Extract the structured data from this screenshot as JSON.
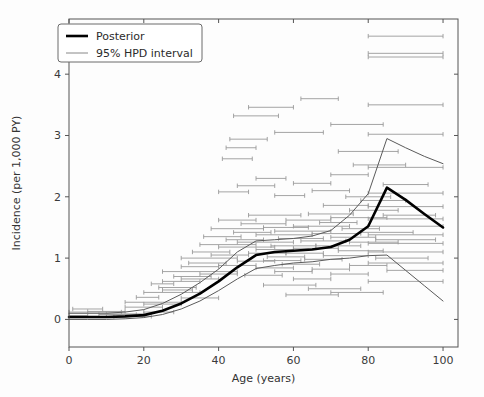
{
  "chart_data": {
    "type": "line",
    "title": "",
    "xlabel": "Age (years)",
    "ylabel": "Incidence (per 1,000 PY)",
    "xlim": [
      0,
      104
    ],
    "ylim": [
      -0.45,
      4.9
    ],
    "xticks": [
      0,
      20,
      40,
      60,
      80,
      100
    ],
    "xtick_labels": [
      "0",
      "20",
      "40",
      "60",
      "80",
      "100"
    ],
    "yticks": [
      0,
      1,
      2,
      3,
      4
    ],
    "ytick_labels": [
      "0",
      "1",
      "2",
      "3",
      "4"
    ],
    "grid": false,
    "legend_position": "upper left",
    "legend": [
      {
        "label": "Posterior",
        "color": "#000000",
        "linewidth": 2.6
      },
      {
        "label": "95% HPD interval",
        "color": "#888888",
        "linewidth": 1.0
      }
    ],
    "series": [
      {
        "name": "Posterior",
        "color": "#000000",
        "linewidth": 2.6,
        "x": [
          0,
          5,
          10,
          15,
          20,
          25,
          30,
          35,
          40,
          45,
          50,
          55,
          60,
          65,
          70,
          75,
          80,
          85,
          90,
          95,
          100
        ],
        "y": [
          0.04,
          0.04,
          0.04,
          0.05,
          0.07,
          0.14,
          0.26,
          0.42,
          0.62,
          0.85,
          1.05,
          1.1,
          1.12,
          1.14,
          1.18,
          1.3,
          1.52,
          2.15,
          1.95,
          1.72,
          1.5
        ]
      },
      {
        "name": "HPD upper",
        "color": "#5a5a5a",
        "linewidth": 1.0,
        "x": [
          0,
          5,
          10,
          15,
          20,
          25,
          30,
          35,
          40,
          45,
          50,
          55,
          60,
          65,
          70,
          75,
          80,
          85,
          90,
          95,
          100
        ],
        "y": [
          0.1,
          0.1,
          0.1,
          0.12,
          0.16,
          0.26,
          0.41,
          0.6,
          0.82,
          1.1,
          1.28,
          1.3,
          1.32,
          1.36,
          1.45,
          1.7,
          2.05,
          2.95,
          2.8,
          2.66,
          2.54
        ]
      },
      {
        "name": "HPD lower",
        "color": "#5a5a5a",
        "linewidth": 1.0,
        "x": [
          0,
          5,
          10,
          15,
          20,
          25,
          30,
          35,
          40,
          45,
          50,
          55,
          60,
          65,
          70,
          75,
          80,
          85,
          90,
          95,
          100
        ],
        "y": [
          0.0,
          0.0,
          0.0,
          0.01,
          0.03,
          0.08,
          0.17,
          0.3,
          0.47,
          0.66,
          0.83,
          0.88,
          0.92,
          0.94,
          0.98,
          1.0,
          1.04,
          1.05,
          0.8,
          0.55,
          0.3
        ]
      }
    ],
    "observations": [
      {
        "x0": 0,
        "x1": 14,
        "y": 0.12
      },
      {
        "x0": 1,
        "x1": 9,
        "y": 0.17
      },
      {
        "x0": 0,
        "x1": 5,
        "y": 0.06
      },
      {
        "x0": 5,
        "x1": 15,
        "y": 0.13
      },
      {
        "x0": 10,
        "x1": 20,
        "y": 0.09
      },
      {
        "x0": 15,
        "x1": 25,
        "y": 0.2
      },
      {
        "x0": 15,
        "x1": 30,
        "y": 0.28
      },
      {
        "x0": 18,
        "x1": 24,
        "y": 0.36
      },
      {
        "x0": 20,
        "x1": 30,
        "y": 0.25
      },
      {
        "x0": 20,
        "x1": 35,
        "y": 0.44
      },
      {
        "x0": 22,
        "x1": 28,
        "y": 0.58
      },
      {
        "x0": 24,
        "x1": 34,
        "y": 0.52
      },
      {
        "x0": 25,
        "x1": 35,
        "y": 0.62
      },
      {
        "x0": 25,
        "x1": 45,
        "y": 0.78
      },
      {
        "x0": 28,
        "x1": 38,
        "y": 0.7
      },
      {
        "x0": 30,
        "x1": 40,
        "y": 0.66
      },
      {
        "x0": 30,
        "x1": 40,
        "y": 0.86
      },
      {
        "x0": 30,
        "x1": 45,
        "y": 1.0
      },
      {
        "x0": 32,
        "x1": 42,
        "y": 0.92
      },
      {
        "x0": 33,
        "x1": 43,
        "y": 1.1
      },
      {
        "x0": 35,
        "x1": 45,
        "y": 0.74
      },
      {
        "x0": 35,
        "x1": 50,
        "y": 1.22
      },
      {
        "x0": 36,
        "x1": 46,
        "y": 1.35
      },
      {
        "x0": 38,
        "x1": 48,
        "y": 1.05
      },
      {
        "x0": 38,
        "x1": 52,
        "y": 1.48
      },
      {
        "x0": 40,
        "x1": 50,
        "y": 0.88
      },
      {
        "x0": 40,
        "x1": 50,
        "y": 1.62
      },
      {
        "x0": 40,
        "x1": 55,
        "y": 1.18
      },
      {
        "x0": 40,
        "x1": 48,
        "y": 2.08
      },
      {
        "x0": 41,
        "x1": 49,
        "y": 2.62
      },
      {
        "x0": 42,
        "x1": 52,
        "y": 1.3
      },
      {
        "x0": 42,
        "x1": 50,
        "y": 2.8
      },
      {
        "x0": 43,
        "x1": 53,
        "y": 2.94
      },
      {
        "x0": 44,
        "x1": 56,
        "y": 3.32
      },
      {
        "x0": 44,
        "x1": 54,
        "y": 1.42
      },
      {
        "x0": 45,
        "x1": 55,
        "y": 0.95
      },
      {
        "x0": 45,
        "x1": 60,
        "y": 1.26
      },
      {
        "x0": 45,
        "x1": 55,
        "y": 2.18
      },
      {
        "x0": 46,
        "x1": 58,
        "y": 1.56
      },
      {
        "x0": 47,
        "x1": 57,
        "y": 0.72
      },
      {
        "x0": 48,
        "x1": 58,
        "y": 1.08
      },
      {
        "x0": 48,
        "x1": 62,
        "y": 1.7
      },
      {
        "x0": 50,
        "x1": 60,
        "y": 0.84
      },
      {
        "x0": 50,
        "x1": 60,
        "y": 1.14
      },
      {
        "x0": 50,
        "x1": 65,
        "y": 1.38
      },
      {
        "x0": 50,
        "x1": 58,
        "y": 2.3
      },
      {
        "x0": 52,
        "x1": 62,
        "y": 0.96
      },
      {
        "x0": 52,
        "x1": 64,
        "y": 1.5
      },
      {
        "x0": 53,
        "x1": 63,
        "y": 1.02
      },
      {
        "x0": 54,
        "x1": 66,
        "y": 1.2
      },
      {
        "x0": 55,
        "x1": 65,
        "y": 0.78
      },
      {
        "x0": 55,
        "x1": 70,
        "y": 1.44
      },
      {
        "x0": 55,
        "x1": 63,
        "y": 2.02
      },
      {
        "x0": 56,
        "x1": 68,
        "y": 1.32
      },
      {
        "x0": 57,
        "x1": 67,
        "y": 0.9
      },
      {
        "x0": 58,
        "x1": 70,
        "y": 1.62
      },
      {
        "x0": 58,
        "x1": 68,
        "y": 1.08
      },
      {
        "x0": 60,
        "x1": 70,
        "y": 0.66
      },
      {
        "x0": 60,
        "x1": 72,
        "y": 1.16
      },
      {
        "x0": 60,
        "x1": 75,
        "y": 1.52
      },
      {
        "x0": 60,
        "x1": 70,
        "y": 2.22
      },
      {
        "x0": 62,
        "x1": 74,
        "y": 1.28
      },
      {
        "x0": 63,
        "x1": 73,
        "y": 0.98
      },
      {
        "x0": 64,
        "x1": 76,
        "y": 1.72
      },
      {
        "x0": 65,
        "x1": 75,
        "y": 0.82
      },
      {
        "x0": 65,
        "x1": 78,
        "y": 1.4
      },
      {
        "x0": 65,
        "x1": 75,
        "y": 2.1
      },
      {
        "x0": 66,
        "x1": 78,
        "y": 1.2
      },
      {
        "x0": 67,
        "x1": 77,
        "y": 1.58
      },
      {
        "x0": 68,
        "x1": 80,
        "y": 1.04
      },
      {
        "x0": 68,
        "x1": 80,
        "y": 1.86
      },
      {
        "x0": 70,
        "x1": 80,
        "y": 0.74
      },
      {
        "x0": 70,
        "x1": 82,
        "y": 1.34
      },
      {
        "x0": 70,
        "x1": 85,
        "y": 1.66
      },
      {
        "x0": 70,
        "x1": 80,
        "y": 2.36
      },
      {
        "x0": 72,
        "x1": 84,
        "y": 1.12
      },
      {
        "x0": 73,
        "x1": 83,
        "y": 1.48
      },
      {
        "x0": 74,
        "x1": 86,
        "y": 2.0
      },
      {
        "x0": 75,
        "x1": 85,
        "y": 0.88
      },
      {
        "x0": 75,
        "x1": 88,
        "y": 1.26
      },
      {
        "x0": 75,
        "x1": 88,
        "y": 1.78
      },
      {
        "x0": 76,
        "x1": 90,
        "y": 2.52
      },
      {
        "x0": 78,
        "x1": 92,
        "y": 1.42
      },
      {
        "x0": 78,
        "x1": 90,
        "y": 1.94
      },
      {
        "x0": 80,
        "x1": 100,
        "y": 0.62
      },
      {
        "x0": 80,
        "x1": 100,
        "y": 0.92
      },
      {
        "x0": 80,
        "x1": 100,
        "y": 1.1
      },
      {
        "x0": 80,
        "x1": 100,
        "y": 1.24
      },
      {
        "x0": 80,
        "x1": 100,
        "y": 1.38
      },
      {
        "x0": 80,
        "x1": 100,
        "y": 1.52
      },
      {
        "x0": 80,
        "x1": 100,
        "y": 1.64
      },
      {
        "x0": 80,
        "x1": 100,
        "y": 1.84
      },
      {
        "x0": 80,
        "x1": 100,
        "y": 2.06
      },
      {
        "x0": 80,
        "x1": 100,
        "y": 2.48
      },
      {
        "x0": 80,
        "x1": 100,
        "y": 3.02
      },
      {
        "x0": 80,
        "x1": 100,
        "y": 3.5
      },
      {
        "x0": 80,
        "x1": 100,
        "y": 4.28
      },
      {
        "x0": 80,
        "x1": 100,
        "y": 4.34
      },
      {
        "x0": 80,
        "x1": 100,
        "y": 4.62
      },
      {
        "x0": 82,
        "x1": 96,
        "y": 1.0
      },
      {
        "x0": 82,
        "x1": 98,
        "y": 1.3
      },
      {
        "x0": 84,
        "x1": 98,
        "y": 1.7
      },
      {
        "x0": 84,
        "x1": 96,
        "y": 2.2
      },
      {
        "x0": 85,
        "x1": 100,
        "y": 0.8
      },
      {
        "x0": 62,
        "x1": 72,
        "y": 3.6
      },
      {
        "x0": 55,
        "x1": 68,
        "y": 3.05
      },
      {
        "x0": 48,
        "x1": 60,
        "y": 3.46
      },
      {
        "x0": 70,
        "x1": 84,
        "y": 3.18
      },
      {
        "x0": 72,
        "x1": 88,
        "y": 2.74
      },
      {
        "x0": 30,
        "x1": 40,
        "y": 0.35
      },
      {
        "x0": 25,
        "x1": 33,
        "y": 0.48
      },
      {
        "x0": 20,
        "x1": 28,
        "y": 0.12
      },
      {
        "x0": 12,
        "x1": 22,
        "y": 0.05
      },
      {
        "x0": 8,
        "x1": 18,
        "y": 0.08
      },
      {
        "x0": 58,
        "x1": 72,
        "y": 0.4
      },
      {
        "x0": 64,
        "x1": 78,
        "y": 0.5
      },
      {
        "x0": 70,
        "x1": 84,
        "y": 0.44
      },
      {
        "x0": 52,
        "x1": 66,
        "y": 0.56
      }
    ]
  }
}
